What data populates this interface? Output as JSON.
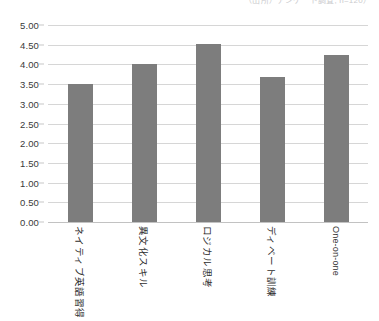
{
  "top_note": "（出所）アンケート調査, n=120）",
  "chart_data": {
    "type": "bar",
    "title": "",
    "xlabel": "",
    "ylabel": "",
    "categories": [
      "ネイティブ英語習得",
      "異文化スキル",
      "ロジカル思考",
      "ディベート訓練",
      "One-on-one"
    ],
    "values": [
      3.5,
      4.0,
      4.52,
      3.68,
      4.25
    ],
    "ylim": [
      0.0,
      5.0
    ],
    "ytick_step": 0.5,
    "ytick_labels": [
      "0.00",
      "0.50",
      "1.00",
      "1.50",
      "2.00",
      "2.50",
      "3.00",
      "3.50",
      "4.00",
      "4.50",
      "5.00"
    ],
    "grid": true,
    "legend": "none",
    "bar_color": "#7d7d7d",
    "grid_color": "#d6d6d6"
  }
}
